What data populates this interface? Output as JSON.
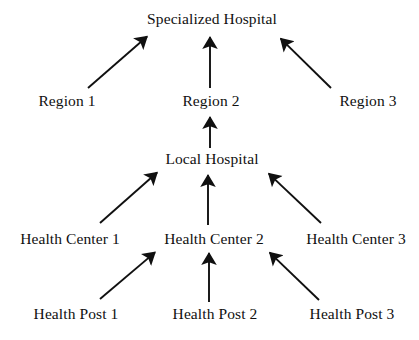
{
  "diagram": {
    "title_text": "Specialized Hospital",
    "background_color": "#ffffff",
    "stroke_color": "#101010",
    "levels": [
      {
        "name": "specialized-hospital-level",
        "nodes": [
          {
            "id": "specialized-hospital",
            "label": "Specialized Hospital",
            "x": 212,
            "y": 18
          }
        ]
      },
      {
        "name": "region-level",
        "nodes": [
          {
            "id": "region-1",
            "label": "Region 1",
            "x": 67,
            "y": 100
          },
          {
            "id": "region-2",
            "label": "Region 2",
            "x": 211,
            "y": 100
          },
          {
            "id": "region-3",
            "label": "Region 3",
            "x": 368,
            "y": 100
          }
        ]
      },
      {
        "name": "local-hospital-level",
        "nodes": [
          {
            "id": "local-hospital",
            "label": "Local Hospital",
            "x": 212,
            "y": 158
          }
        ]
      },
      {
        "name": "health-center-level",
        "nodes": [
          {
            "id": "health-center-1",
            "label": "Health Center 1",
            "x": 70,
            "y": 238
          },
          {
            "id": "health-center-2",
            "label": "Health Center 2",
            "x": 214,
            "y": 238
          },
          {
            "id": "health-center-3",
            "label": "Health Center 3",
            "x": 356,
            "y": 238
          }
        ]
      },
      {
        "name": "health-post-level",
        "nodes": [
          {
            "id": "health-post-1",
            "label": "Health Post 1",
            "x": 76,
            "y": 313
          },
          {
            "id": "health-post-2",
            "label": "Health Post 2",
            "x": 215,
            "y": 313
          },
          {
            "id": "health-post-3",
            "label": "Health Post 3",
            "x": 352,
            "y": 313
          }
        ]
      }
    ],
    "arrows": [
      {
        "id": "region-1-to-specialized-hospital",
        "from": "region-1",
        "to": "specialized-hospital",
        "x1": 88,
        "y1": 88,
        "x2": 151,
        "y2": 33
      },
      {
        "id": "region-2-to-specialized-hospital",
        "from": "region-2",
        "to": "specialized-hospital",
        "x1": 210,
        "y1": 88,
        "x2": 210,
        "y2": 32
      },
      {
        "id": "region-3-to-specialized-hospital",
        "from": "region-3",
        "to": "specialized-hospital",
        "x1": 331,
        "y1": 88,
        "x2": 277,
        "y2": 35
      },
      {
        "id": "local-hospital-to-region-2",
        "from": "local-hospital",
        "to": "region-2",
        "x1": 210,
        "y1": 148,
        "x2": 210,
        "y2": 112
      },
      {
        "id": "health-center-1-to-local-hospital",
        "from": "health-center-1",
        "to": "local-hospital",
        "x1": 100,
        "y1": 223,
        "x2": 161,
        "y2": 169
      },
      {
        "id": "health-center-2-to-local-hospital",
        "from": "health-center-2",
        "to": "local-hospital",
        "x1": 208,
        "y1": 225,
        "x2": 208,
        "y2": 170
      },
      {
        "id": "health-center-3-to-local-hospital",
        "from": "health-center-3",
        "to": "local-hospital",
        "x1": 321,
        "y1": 223,
        "x2": 265,
        "y2": 170
      },
      {
        "id": "health-post-1-to-health-center-2",
        "from": "health-post-1",
        "to": "health-center-2",
        "x1": 100,
        "y1": 299,
        "x2": 159,
        "y2": 249
      },
      {
        "id": "health-post-2-to-health-center-2",
        "from": "health-post-2",
        "to": "health-center-2",
        "x1": 209,
        "y1": 302,
        "x2": 209,
        "y2": 248
      },
      {
        "id": "health-post-3-to-health-center-2",
        "from": "health-post-3",
        "to": "health-center-2",
        "x1": 319,
        "y1": 300,
        "x2": 266,
        "y2": 249
      }
    ]
  }
}
